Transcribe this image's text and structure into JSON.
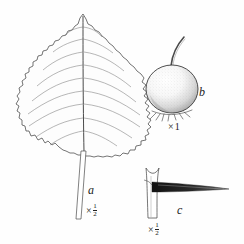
{
  "plate": {
    "kind": "botanical-line-drawing",
    "background_color": "#fefefe",
    "ink_color": "#222222",
    "figures": [
      {
        "key": "a",
        "label": "a",
        "subject": "leaf",
        "description": "Ovate leaf with doubly serrate, slightly lobed margin, pinnate venation and long slender petiole",
        "scale_prefix": "×",
        "scale_numerator": "1",
        "scale_denominator": "2",
        "vein_pairs": 9
      },
      {
        "key": "b",
        "label": "b",
        "subject": "fruit",
        "description": "Rounded stippled pome with slender stalk and persistent calyx at base",
        "scale_prefix": "×",
        "scale_whole": "1"
      },
      {
        "key": "c",
        "label": "c",
        "subject": "thorn",
        "description": "Long tapering thorn arising from a twig",
        "scale_prefix": "×",
        "scale_numerator": "1",
        "scale_denominator": "2"
      }
    ]
  }
}
